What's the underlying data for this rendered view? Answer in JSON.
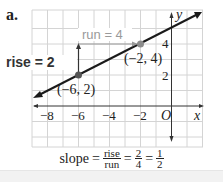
{
  "part_label": "a.",
  "graph": {
    "x_axis_label": "x",
    "y_axis_label": "y",
    "origin_label": "O",
    "x_tick_labels": [
      "−8",
      "−6",
      "−4",
      "−2"
    ],
    "y_tick_labels": [
      "4",
      "2"
    ],
    "points": [
      {
        "label": "(−6, 2)",
        "x": -6,
        "y": 2
      },
      {
        "label": "(−2, 4)",
        "x": -2,
        "y": 4
      }
    ],
    "rise_label": "rise = 2",
    "run_label": "run = 4",
    "colors": {
      "grid": "#d4d4d4",
      "line": "#1a1a1a",
      "annotation": "#333333",
      "run_annotation": "#9a9a9a",
      "point": "#8c8c8c"
    }
  },
  "formula": {
    "lhs": "slope",
    "eq": "=",
    "frac1_num": "rise",
    "frac1_den": "run",
    "frac2_num": "2",
    "frac2_den": "4",
    "frac3_num": "1",
    "frac3_den": "2"
  }
}
